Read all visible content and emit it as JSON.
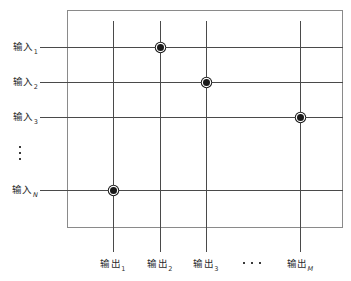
{
  "diagram": {
    "box": {
      "x": 67,
      "y": 10,
      "width": 276,
      "height": 218,
      "border_color": "#8a8a8a"
    },
    "line_color": "#4a4a4a",
    "dot_color": "#1a1a1a",
    "rows": [
      {
        "id": "input-1",
        "base": "输入",
        "subscript": "1",
        "subscript_italic": false,
        "y": 47
      },
      {
        "id": "input-2",
        "base": "输入",
        "subscript": "2",
        "subscript_italic": false,
        "y": 82
      },
      {
        "id": "input-3",
        "base": "输入",
        "subscript": "3",
        "subscript_italic": false,
        "y": 117
      },
      {
        "id": "input-N",
        "base": "输入",
        "subscript": "N",
        "subscript_italic": true,
        "y": 190
      }
    ],
    "row_ellipsis": {
      "label": "⋮",
      "dots": 3,
      "y": 146
    },
    "columns": [
      {
        "id": "output-1",
        "base": "输出",
        "subscript": "1",
        "subscript_italic": false,
        "x": 113
      },
      {
        "id": "output-2",
        "base": "输出",
        "subscript": "2",
        "subscript_italic": false,
        "x": 160
      },
      {
        "id": "output-3",
        "base": "输出",
        "subscript": "3",
        "subscript_italic": false,
        "x": 206
      },
      {
        "id": "output-M",
        "base": "输出",
        "subscript": "M",
        "subscript_italic": true,
        "x": 300
      }
    ],
    "column_ellipsis": {
      "label": "⋯",
      "dots": 3,
      "x": 250
    },
    "crosspoints": [
      {
        "id": "crosspoint-in1-out2",
        "row": "input-1",
        "column": "output-2",
        "x": 160,
        "y": 47
      },
      {
        "id": "crosspoint-in2-out3",
        "row": "input-2",
        "column": "output-3",
        "x": 206,
        "y": 82
      },
      {
        "id": "crosspoint-in3-outM",
        "row": "input-3",
        "column": "output-M",
        "x": 300,
        "y": 117
      },
      {
        "id": "crosspoint-inN-out1",
        "row": "input-N",
        "column": "output-1",
        "x": 113,
        "y": 190
      }
    ]
  }
}
